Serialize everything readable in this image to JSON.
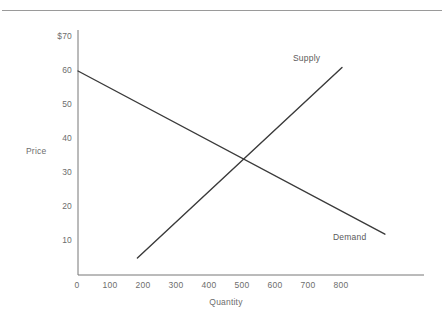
{
  "page": {
    "background_color": "#ffffff",
    "rule_color": "#9a9a9a",
    "text_color": "#6d6d6d",
    "line_color": "#3a3a3a"
  },
  "chart_data": {
    "type": "line",
    "title": "",
    "subtitle": "",
    "xlabel": "Quantity",
    "ylabel": "Price",
    "xlim": [
      0,
      1000
    ],
    "ylim": [
      0,
      70
    ],
    "grid": false,
    "legend_position": "inline-annotation",
    "x_ticks": [
      "0",
      "100",
      "200",
      "300",
      "400",
      "500",
      "600",
      "700",
      "800"
    ],
    "x_tick_values": [
      0,
      100,
      200,
      300,
      400,
      500,
      600,
      700,
      800
    ],
    "y_ticks": [
      "10",
      "20",
      "30",
      "40",
      "50",
      "60",
      "$70"
    ],
    "y_tick_values": [
      10,
      20,
      30,
      40,
      50,
      60,
      70
    ],
    "y_axis_currency_symbol": "$",
    "series": [
      {
        "name": "Demand",
        "slope_direction": "downward",
        "points": [
          {
            "x": 0,
            "y": 60
          },
          {
            "x": 930,
            "y": 12
          }
        ],
        "label": "Demand",
        "label_x": 790,
        "label_y": 13
      },
      {
        "name": "Supply",
        "slope_direction": "upward",
        "points": [
          {
            "x": 180,
            "y": 5
          },
          {
            "x": 800,
            "y": 61
          }
        ],
        "label": "Supply",
        "label_x": 660,
        "label_y": 64
      }
    ],
    "equilibrium": {
      "x": 500,
      "y": 34
    },
    "annotations": [
      "Supply",
      "Demand"
    ]
  }
}
